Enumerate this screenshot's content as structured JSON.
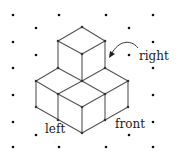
{
  "diagram": {
    "type": "isometric-cube-stack",
    "labels": {
      "right": "right",
      "left": "left",
      "front": "front"
    },
    "colors": {
      "edge": "#555555",
      "dot": "#111111",
      "text": "#222222",
      "background": "#ffffff"
    }
  }
}
